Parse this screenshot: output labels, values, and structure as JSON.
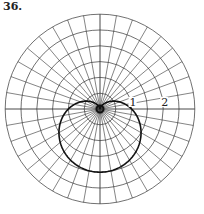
{
  "problem": {
    "number": "36."
  },
  "chart_data": {
    "type": "line",
    "coordinate_system": "polar",
    "title": "",
    "curve": {
      "equation": "r = 1 - sin(theta)",
      "description": "cardioid passing through pole at theta = pi/2, maximum r = 2 at theta = 3pi/2",
      "points": [
        {
          "theta_deg": 0,
          "r": 1.0
        },
        {
          "theta_deg": 30,
          "r": 0.5
        },
        {
          "theta_deg": 60,
          "r": 0.134
        },
        {
          "theta_deg": 90,
          "r": 0.0
        },
        {
          "theta_deg": 120,
          "r": 0.134
        },
        {
          "theta_deg": 150,
          "r": 0.5
        },
        {
          "theta_deg": 180,
          "r": 1.0
        },
        {
          "theta_deg": 210,
          "r": 1.5
        },
        {
          "theta_deg": 240,
          "r": 1.866
        },
        {
          "theta_deg": 270,
          "r": 2.0
        },
        {
          "theta_deg": 300,
          "r": 1.866
        },
        {
          "theta_deg": 330,
          "r": 1.5
        },
        {
          "theta_deg": 360,
          "r": 1.0
        }
      ]
    },
    "grid": {
      "on": true,
      "radial_circles": [
        0.5,
        1.0,
        1.5,
        2.0,
        2.5,
        3.0
      ],
      "spoke_step_deg": 10,
      "r_max": 3.0
    },
    "tick_labels": [
      {
        "text": "1",
        "r": 1,
        "theta_deg": 0
      },
      {
        "text": "2",
        "r": 2,
        "theta_deg": 0
      }
    ],
    "colors": {
      "grid": "#333333",
      "curve": "#111111",
      "background": "#ffffff"
    }
  }
}
